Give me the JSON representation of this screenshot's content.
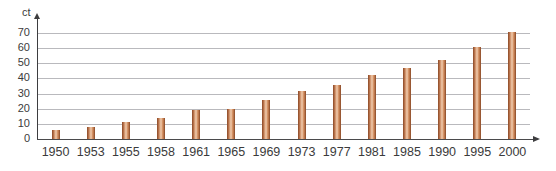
{
  "caption": {
    "clipped_top_line": ""
  },
  "axes": {
    "y_unit_label": "ct",
    "y_ticks": [
      0,
      10,
      20,
      30,
      40,
      50,
      60,
      70
    ],
    "y_axis_icon": "up-arrow-icon",
    "x_axis_icon": "right-arrow-icon"
  },
  "style": {
    "bar_color_dark": "#8a4b2a",
    "bar_color_mid": "#c07a4d",
    "bar_color_light": "#f0cdb0",
    "gridline_color": "#b9b9bd",
    "axis_color": "#3d3d3f",
    "text_color": "#3b3b3b",
    "background": "#ffffff"
  },
  "chart_data": {
    "type": "bar",
    "title": "",
    "xlabel": "",
    "ylabel": "ct",
    "ylim": [
      0,
      75
    ],
    "grid": true,
    "legend": "none",
    "categories": [
      "1950",
      "1953",
      "1955",
      "1958",
      "1961",
      "1965",
      "1969",
      "1973",
      "1977",
      "1981",
      "1985",
      "1990",
      "1995",
      "2000"
    ],
    "values": [
      6,
      8,
      11,
      14,
      19,
      20,
      26,
      32,
      36,
      42,
      47,
      52,
      61,
      71
    ]
  }
}
